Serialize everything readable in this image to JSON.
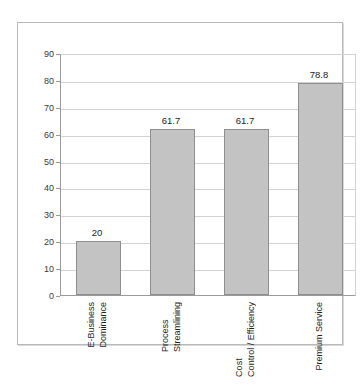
{
  "chart_data": {
    "type": "bar",
    "title": "",
    "subtitle": "",
    "xlabel": "",
    "ylabel": "",
    "ylim": [
      0,
      90
    ],
    "ytick_step": 10,
    "yticks": [
      90,
      80,
      70,
      60,
      50,
      40,
      30,
      20,
      10,
      0
    ],
    "grid": true,
    "legend": "none",
    "orientation": "vertical",
    "category_label_rotation": 90,
    "categories": [
      "E-Business Dominance",
      "Process Streamlining",
      "Cost Control / Efficiency",
      "Premium Service"
    ],
    "category_lines": [
      [
        "E-Business",
        "Dominance"
      ],
      [
        "Process",
        "Streamlining"
      ],
      [
        "Cost",
        "Control / Efficiency"
      ],
      [
        "Premium Service"
      ]
    ],
    "values": [
      20,
      61.7,
      61.7,
      78.8
    ],
    "value_labels": [
      "20",
      "61.7",
      "61.7",
      "78.8"
    ],
    "colors": {
      "bar_fill": "#c3c3c3",
      "bar_border": "#8e8e8e",
      "gridline": "#d2d2d2",
      "axis": "#9a9a9a",
      "frame": "#b9b9b9",
      "text": "#1d1d1d",
      "background": "#ffffff"
    }
  }
}
